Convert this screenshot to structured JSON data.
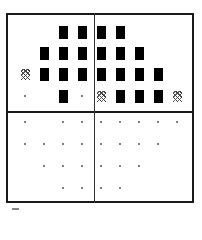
{
  "diagram": {
    "columns": 9,
    "column_centers_px": [
      25,
      44,
      63,
      82,
      101,
      120,
      139,
      158,
      177
    ],
    "legend": {
      "B": "black-block",
      "D": "dithered-tile",
      ".": "dot",
      "_": "empty"
    },
    "upper": {
      "row_centers_px": [
        32,
        53,
        74,
        96
      ],
      "rows": [
        [
          "_",
          "_",
          "B",
          "B",
          "B",
          "B",
          "_",
          "_",
          "_"
        ],
        [
          "_",
          "B",
          "B",
          "B",
          "B",
          "B",
          "B",
          "_",
          "_"
        ],
        [
          "D",
          "B",
          "B",
          "B",
          "B",
          "B",
          "B",
          "B",
          "_"
        ],
        [
          ".",
          "_",
          "B",
          ".",
          "D",
          "B",
          "B",
          "B",
          "D"
        ]
      ]
    },
    "lower": {
      "row_centers_px": [
        122,
        144,
        166,
        188
      ],
      "rows": [
        [
          ".",
          "_",
          ".",
          ".",
          ".",
          ".",
          ".",
          ".",
          "."
        ],
        [
          ".",
          ".",
          ".",
          ".",
          ".",
          ".",
          ".",
          ".",
          "_"
        ],
        [
          "_",
          ".",
          ".",
          ".",
          ".",
          ".",
          ".",
          "_",
          "_"
        ],
        [
          "_",
          "_",
          ".",
          ".",
          ".",
          ".",
          "_",
          "_",
          "_"
        ]
      ]
    },
    "colors": {
      "frame": "#1a1a1a",
      "block": "#000000",
      "dot": "#555555",
      "background": "#ffffff"
    }
  }
}
